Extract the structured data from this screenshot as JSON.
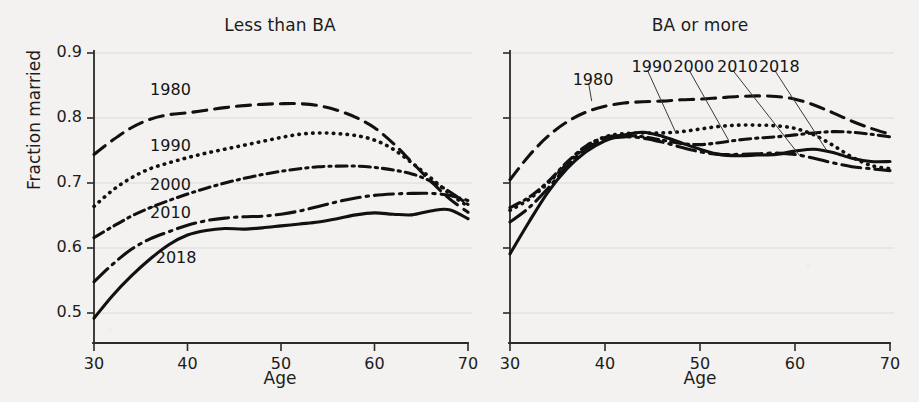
{
  "figure": {
    "ylabel": "Fraction married",
    "xlabel": "Age",
    "background_color": "#f3f2f0",
    "line_color": "#111111"
  },
  "panels": [
    {
      "title": "Less than BA",
      "xlabel": "Age"
    },
    {
      "title": "BA or more",
      "xlabel": "Age"
    }
  ],
  "ticks": {
    "y": [
      "0.9",
      "0.8",
      "0.7",
      "0.6",
      "0.5"
    ],
    "x": [
      "30",
      "40",
      "50",
      "60",
      "70"
    ]
  },
  "series_labels": [
    "1980",
    "1990",
    "2000",
    "2010",
    "2018"
  ],
  "chart_data": {
    "type": "line",
    "xlabel": "Age",
    "ylabel": "Fraction married",
    "xlim": [
      30,
      70
    ],
    "ylim": [
      0.5,
      0.9
    ],
    "xticks": [
      30,
      40,
      50,
      60,
      70
    ],
    "yticks": [
      0.5,
      0.6,
      0.7,
      0.8,
      0.9
    ],
    "grid": true,
    "legend": "inline-annotations",
    "panels": [
      {
        "name": "Less than BA",
        "x": [
          30,
          32,
          34,
          36,
          38,
          40,
          42,
          44,
          46,
          48,
          50,
          52,
          54,
          56,
          58,
          60,
          62,
          64,
          66,
          68,
          70
        ],
        "series": [
          {
            "name": "1980",
            "dash": "dashed",
            "values": [
              0.744,
              0.766,
              0.785,
              0.798,
              0.805,
              0.808,
              0.812,
              0.816,
              0.819,
              0.821,
              0.822,
              0.822,
              0.819,
              0.812,
              0.801,
              0.785,
              0.761,
              0.732,
              0.703,
              0.676,
              0.655
            ]
          },
          {
            "name": "1990",
            "dash": "dotted",
            "values": [
              0.664,
              0.689,
              0.708,
              0.722,
              0.731,
              0.739,
              0.746,
              0.752,
              0.758,
              0.764,
              0.77,
              0.775,
              0.777,
              0.776,
              0.773,
              0.766,
              0.752,
              0.731,
              0.708,
              0.684,
              0.664
            ]
          },
          {
            "name": "2000",
            "dash": "dash-dot",
            "values": [
              0.616,
              0.633,
              0.649,
              0.662,
              0.673,
              0.683,
              0.692,
              0.7,
              0.707,
              0.713,
              0.718,
              0.722,
              0.725,
              0.726,
              0.726,
              0.724,
              0.72,
              0.714,
              0.703,
              0.687,
              0.667
            ]
          },
          {
            "name": "2010",
            "dash": "long-dash-dot",
            "values": [
              0.548,
              0.575,
              0.598,
              0.614,
              0.625,
              0.635,
              0.642,
              0.646,
              0.648,
              0.649,
              0.652,
              0.657,
              0.664,
              0.671,
              0.677,
              0.681,
              0.683,
              0.684,
              0.684,
              0.681,
              0.673
            ]
          },
          {
            "name": "2018",
            "dash": "solid",
            "values": [
              0.492,
              0.527,
              0.557,
              0.583,
              0.605,
              0.62,
              0.627,
              0.63,
              0.629,
              0.631,
              0.634,
              0.637,
              0.64,
              0.645,
              0.651,
              0.654,
              0.652,
              0.651,
              0.657,
              0.659,
              0.645
            ]
          }
        ]
      },
      {
        "name": "BA or more",
        "x": [
          30,
          32,
          34,
          36,
          38,
          40,
          42,
          44,
          46,
          48,
          50,
          52,
          54,
          56,
          58,
          60,
          62,
          64,
          66,
          68,
          70
        ],
        "series": [
          {
            "name": "1980",
            "dash": "dashed",
            "values": [
              0.705,
              0.742,
              0.772,
              0.794,
              0.809,
              0.818,
              0.823,
              0.825,
              0.826,
              0.828,
              0.829,
              0.831,
              0.833,
              0.834,
              0.833,
              0.829,
              0.82,
              0.808,
              0.795,
              0.784,
              0.775
            ]
          },
          {
            "name": "1990",
            "dash": "dotted",
            "values": [
              0.658,
              0.675,
              0.7,
              0.729,
              0.756,
              0.771,
              0.776,
              0.777,
              0.777,
              0.779,
              0.783,
              0.787,
              0.789,
              0.789,
              0.788,
              0.784,
              0.774,
              0.758,
              0.74,
              0.727,
              0.722
            ]
          },
          {
            "name": "2000",
            "dash": "dash-dot",
            "values": [
              0.662,
              0.678,
              0.702,
              0.732,
              0.757,
              0.77,
              0.773,
              0.771,
              0.766,
              0.761,
              0.759,
              0.762,
              0.766,
              0.769,
              0.771,
              0.774,
              0.777,
              0.779,
              0.778,
              0.775,
              0.771
            ]
          },
          {
            "name": "2010",
            "dash": "long-dash-dot",
            "values": [
              0.64,
              0.662,
              0.692,
              0.726,
              0.753,
              0.767,
              0.771,
              0.769,
              0.763,
              0.755,
              0.748,
              0.744,
              0.744,
              0.745,
              0.746,
              0.744,
              0.738,
              0.731,
              0.725,
              0.722,
              0.719
            ]
          },
          {
            "name": "2018",
            "dash": "solid",
            "values": [
              0.591,
              0.64,
              0.686,
              0.722,
              0.748,
              0.765,
              0.774,
              0.778,
              0.772,
              0.762,
              0.752,
              0.744,
              0.742,
              0.743,
              0.744,
              0.749,
              0.752,
              0.747,
              0.738,
              0.733,
              0.733
            ]
          }
        ]
      }
    ],
    "annotations": {
      "left_panel": [
        {
          "label": "1980",
          "x": 36.0,
          "y": 0.843
        },
        {
          "label": "1990",
          "x": 36.0,
          "y": 0.757
        },
        {
          "label": "2000",
          "x": 36.0,
          "y": 0.697
        },
        {
          "label": "2010",
          "x": 36.0,
          "y": 0.654
        },
        {
          "label": "2018",
          "x": 36.6,
          "y": 0.584
        }
      ],
      "right_panel": [
        {
          "label": "1980",
          "x": 36.6,
          "y": 0.859,
          "leader_to": [
            38.6,
            0.826
          ]
        },
        {
          "label": "1990",
          "x": 42.8,
          "y": 0.879,
          "leader_to": [
            47.5,
            0.776
          ]
        },
        {
          "label": "2000",
          "x": 47.2,
          "y": 0.879,
          "leader_to": [
            53.0,
            0.766
          ]
        },
        {
          "label": "2010",
          "x": 51.8,
          "y": 0.879,
          "leader_to": [
            60.5,
            0.742
          ]
        },
        {
          "label": "2018",
          "x": 56.2,
          "y": 0.879,
          "leader_to": [
            63.3,
            0.751
          ]
        }
      ]
    }
  }
}
